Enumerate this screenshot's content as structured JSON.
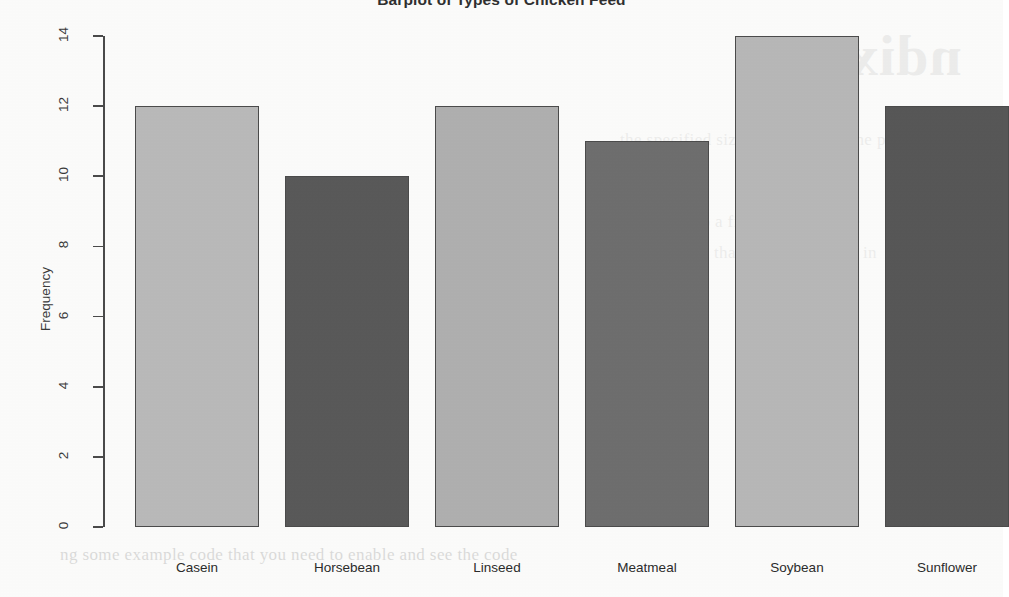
{
  "chart_data": {
    "type": "bar",
    "title": "Barplot of Types of Chicken Feed",
    "xlabel": "",
    "ylabel": "Frequency",
    "categories": [
      "Casein",
      "Horsebean",
      "Linseed",
      "Meatmeal",
      "Soybean",
      "Sunflower"
    ],
    "values": [
      12,
      10,
      12,
      11,
      14,
      12
    ],
    "ylim": [
      0,
      14
    ],
    "yticks": [
      0,
      2,
      4,
      6,
      8,
      10,
      12,
      14
    ],
    "ytick_labels": [
      "0",
      "2",
      "4",
      "6",
      "8",
      "10",
      "12",
      "14"
    ],
    "grid": false,
    "legend": "none",
    "bar_colors": [
      "#b9b9b9",
      "#595959",
      "#afafaf",
      "#6e6e6e",
      "#b7b7b7",
      "#575757"
    ],
    "bar_border_color": "#4b4b4b",
    "axis_color": "#4a4a4a"
  },
  "artifacts": {
    "bleed_heading": "ndix",
    "bleed_lines": [
      "the specified size and shape for the plot",
      "can be saved to a file using the code",
      "produce plots that can be included in",
      "ng some example code that you need to enable and see the code"
    ]
  }
}
